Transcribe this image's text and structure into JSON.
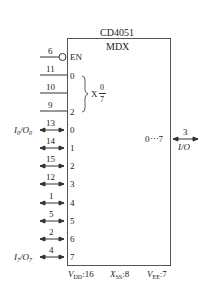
{
  "chip": {
    "name": "CD4051",
    "function": "MDX"
  },
  "enable": {
    "pin": "6",
    "label": "EN"
  },
  "address_inputs": [
    {
      "pin": "11",
      "label": "0"
    },
    {
      "pin": "10",
      "label": ""
    },
    {
      "pin": "9",
      "label": "2"
    }
  ],
  "address_group": {
    "label": "X",
    "frac_top": "0",
    "frac_bottom": "7"
  },
  "channels": [
    {
      "pin": "13",
      "label": "0",
      "name": "I0/O0"
    },
    {
      "pin": "14",
      "label": "1",
      "name": ""
    },
    {
      "pin": "15",
      "label": "2",
      "name": ""
    },
    {
      "pin": "12",
      "label": "3",
      "name": ""
    },
    {
      "pin": "1",
      "label": "4",
      "name": ""
    },
    {
      "pin": "5",
      "label": "5",
      "name": ""
    },
    {
      "pin": "2",
      "label": "6",
      "name": ""
    },
    {
      "pin": "4",
      "label": "7",
      "name": "I7/O7"
    }
  ],
  "common": {
    "pin": "3",
    "range_label": "0⋯7",
    "name": "I/O"
  },
  "power": {
    "vdd": {
      "label": "V",
      "sub": "DD",
      "pin": ":16"
    },
    "vss": {
      "label": "X",
      "sub": "SS",
      "pin": ":8"
    },
    "vee": {
      "label": "V",
      "sub": "EE",
      "pin": ":7"
    }
  }
}
